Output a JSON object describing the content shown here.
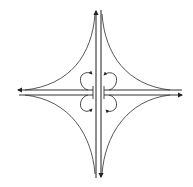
{
  "diagram": {
    "type": "cloverleaf-interchange",
    "background": "#ffffff",
    "stroke_color": "#333333",
    "canvas": {
      "width": 193,
      "height": 187
    },
    "highways": [
      {
        "id": "vertical-highway",
        "lanes": [
          {
            "direction": "north",
            "x": 96,
            "y_start": 178,
            "y_end": 9
          },
          {
            "direction": "south",
            "x": 101,
            "y_start": 10,
            "y_end": 178
          }
        ]
      },
      {
        "id": "horizontal-highway",
        "lanes": [
          {
            "direction": "west",
            "y": 90,
            "x_start": 182,
            "x_end": 16
          },
          {
            "direction": "east",
            "y": 95,
            "x_start": 19,
            "x_end": 183
          }
        ]
      }
    ],
    "outer_ramps": [
      {
        "quadrant": "top-left"
      },
      {
        "quadrant": "top-right"
      },
      {
        "quadrant": "bottom-left"
      },
      {
        "quadrant": "bottom-right"
      }
    ],
    "loop_ramps": [
      {
        "quadrant": "top-left",
        "arrow": "clockwise"
      },
      {
        "quadrant": "top-right",
        "arrow": "counter-clockwise"
      },
      {
        "quadrant": "bottom-left",
        "arrow": "counter-clockwise"
      },
      {
        "quadrant": "bottom-right",
        "arrow": "clockwise"
      }
    ]
  }
}
